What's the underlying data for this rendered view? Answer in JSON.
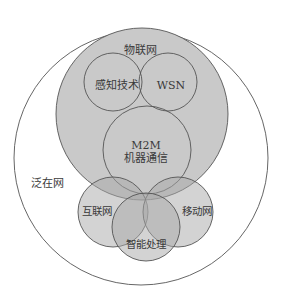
{
  "diagram": {
    "type": "nested-venn",
    "colors": {
      "background": "#ffffff",
      "outline": "#555555",
      "iot_fill": "#c9c9c9",
      "subset_fill": "#a8a8a8",
      "subset_opacity": 0.55
    },
    "labels": {
      "ubiquitous_network": "泛在网",
      "iot": "物联网",
      "sensing": "感知技术",
      "wsn": "WSN",
      "m2m_line1": "M2M",
      "m2m_line2": "机器通信",
      "internet": "互联网",
      "mobile": "移动网",
      "intelligent": "智能处理"
    }
  }
}
